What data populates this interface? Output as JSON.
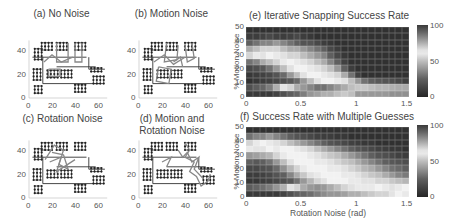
{
  "panels": {
    "a": {
      "title": "(a) No Noise"
    },
    "b": {
      "title": "(b) Motion Noise"
    },
    "c": {
      "title": "(c) Rotation Noise"
    },
    "d": {
      "title_line1": "(d) Motion and",
      "title_line2": "Rotation Noise"
    },
    "e": {
      "title": "(e) Iterative Snapping Success Rate"
    },
    "f": {
      "title": "(f) Success Rate with Multiple Guesses"
    }
  },
  "network_axes": {
    "x_ticks": [
      "0",
      "20",
      "40",
      "60"
    ],
    "y_ticks": [
      "0",
      "20",
      "40"
    ]
  },
  "heatmap_axes": {
    "ylabel": "% Motion Noise",
    "xlabel": "Rotation Noise (rad)",
    "x_ticks": [
      "0",
      "0.5",
      "1",
      "1.5"
    ],
    "y_ticks": [
      "50",
      "40",
      "30",
      "20",
      "10",
      "0"
    ],
    "colorbar_ticks": [
      "100",
      "50",
      "0"
    ]
  },
  "chart_data": [
    {
      "type": "heatmap",
      "title": "(e) Iterative Snapping Success Rate",
      "xlabel": "Rotation Noise (rad)",
      "ylabel": "% Motion Noise",
      "xlim": [
        0,
        1.5
      ],
      "ylim": [
        0,
        50
      ],
      "clim": [
        0,
        100
      ],
      "rows_top_to_bottom": [
        [
          5,
          5,
          5,
          5,
          5,
          5,
          5,
          5,
          5,
          5,
          5,
          5,
          5,
          5,
          5,
          5,
          5,
          5,
          5,
          5,
          5,
          5,
          5,
          5
        ],
        [
          10,
          10,
          12,
          15,
          12,
          10,
          12,
          15,
          10,
          8,
          5,
          5,
          5,
          5,
          5,
          5,
          5,
          5,
          5,
          5,
          5,
          5,
          5,
          5
        ],
        [
          25,
          30,
          35,
          35,
          40,
          35,
          30,
          25,
          20,
          20,
          15,
          10,
          8,
          5,
          5,
          5,
          5,
          5,
          5,
          5,
          5,
          5,
          5,
          5
        ],
        [
          45,
          50,
          55,
          55,
          55,
          50,
          45,
          45,
          40,
          35,
          30,
          25,
          15,
          10,
          5,
          5,
          5,
          5,
          5,
          5,
          5,
          5,
          5,
          5
        ],
        [
          55,
          60,
          65,
          62,
          60,
          58,
          55,
          55,
          50,
          45,
          40,
          35,
          25,
          15,
          8,
          5,
          5,
          5,
          5,
          5,
          5,
          5,
          5,
          5
        ],
        [
          30,
          35,
          45,
          50,
          55,
          60,
          62,
          60,
          58,
          55,
          50,
          45,
          35,
          25,
          12,
          5,
          5,
          5,
          5,
          5,
          5,
          5,
          5,
          5
        ],
        [
          15,
          18,
          22,
          30,
          40,
          50,
          58,
          62,
          62,
          60,
          58,
          55,
          50,
          40,
          25,
          10,
          5,
          5,
          5,
          5,
          5,
          5,
          5,
          5
        ],
        [
          8,
          10,
          12,
          15,
          20,
          28,
          40,
          50,
          58,
          62,
          62,
          60,
          58,
          55,
          45,
          30,
          12,
          5,
          5,
          5,
          5,
          5,
          5,
          5
        ],
        [
          5,
          8,
          10,
          12,
          15,
          18,
          22,
          28,
          40,
          50,
          58,
          62,
          62,
          60,
          58,
          50,
          40,
          30,
          25,
          22,
          20,
          18,
          15,
          12
        ],
        [
          95,
          92,
          90,
          85,
          75,
          65,
          55,
          45,
          40,
          35,
          30,
          30,
          35,
          40,
          45,
          50,
          52,
          52,
          50,
          48,
          48,
          46,
          45,
          45
        ],
        [
          100,
          100,
          100,
          100,
          98,
          95,
          92,
          90,
          85,
          80,
          78,
          75,
          75,
          72,
          70,
          50,
          40,
          40,
          40,
          40,
          40,
          38,
          38,
          38
        ]
      ]
    },
    {
      "type": "heatmap",
      "title": "(f) Success Rate with Multiple Guesses",
      "xlabel": "Rotation Noise (rad)",
      "ylabel": "% Motion Noise",
      "xlim": [
        0,
        1.5
      ],
      "ylim": [
        0,
        50
      ],
      "clim": [
        0,
        100
      ],
      "rows_top_to_bottom": [
        [
          5,
          5,
          5,
          5,
          5,
          5,
          5,
          5,
          5,
          5,
          5,
          5,
          5,
          5,
          5,
          5,
          5,
          5,
          5,
          5,
          5,
          5,
          5,
          5
        ],
        [
          30,
          35,
          35,
          40,
          35,
          30,
          25,
          20,
          18,
          15,
          12,
          10,
          10,
          8,
          8,
          5,
          5,
          5,
          5,
          5,
          5,
          5,
          5,
          5
        ],
        [
          55,
          60,
          62,
          60,
          58,
          55,
          50,
          45,
          40,
          35,
          30,
          25,
          20,
          18,
          15,
          12,
          10,
          8,
          8,
          5,
          5,
          5,
          5,
          5
        ],
        [
          60,
          65,
          65,
          62,
          60,
          62,
          62,
          60,
          58,
          55,
          50,
          45,
          40,
          35,
          30,
          25,
          20,
          18,
          15,
          12,
          10,
          8,
          8,
          5
        ],
        [
          40,
          42,
          45,
          48,
          55,
          60,
          62,
          62,
          62,
          60,
          58,
          55,
          52,
          50,
          45,
          40,
          35,
          30,
          25,
          20,
          18,
          15,
          12,
          10
        ],
        [
          25,
          22,
          25,
          30,
          40,
          50,
          58,
          62,
          62,
          62,
          60,
          60,
          58,
          55,
          52,
          50,
          45,
          40,
          35,
          30,
          25,
          22,
          20,
          18
        ],
        [
          15,
          15,
          18,
          20,
          28,
          38,
          48,
          55,
          60,
          62,
          62,
          62,
          60,
          60,
          58,
          55,
          52,
          48,
          45,
          40,
          35,
          30,
          28,
          25
        ],
        [
          10,
          10,
          12,
          15,
          20,
          25,
          35,
          45,
          52,
          58,
          60,
          62,
          62,
          62,
          60,
          60,
          58,
          55,
          52,
          50,
          45,
          40,
          35,
          32
        ],
        [
          8,
          8,
          10,
          12,
          15,
          18,
          22,
          30,
          40,
          48,
          55,
          58,
          62,
          62,
          62,
          60,
          60,
          58,
          58,
          55,
          55,
          52,
          50,
          48
        ],
        [
          92,
          90,
          88,
          85,
          80,
          75,
          65,
          55,
          45,
          40,
          38,
          40,
          45,
          50,
          55,
          58,
          60,
          60,
          60,
          62,
          60,
          58,
          60,
          62
        ],
        [
          100,
          100,
          100,
          100,
          100,
          98,
          95,
          92,
          90,
          88,
          85,
          82,
          80,
          80,
          78,
          75,
          75,
          72,
          70,
          68,
          68,
          65,
          62,
          60
        ]
      ]
    }
  ]
}
